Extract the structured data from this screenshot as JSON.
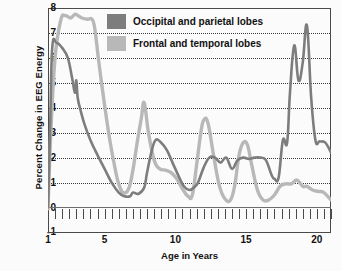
{
  "chart_data": {
    "type": "line",
    "title": "",
    "xlabel": "Age in Years",
    "ylabel": "Percent Change in EEG Energy",
    "xlim": [
      1,
      21
    ],
    "ylim": [
      -1,
      8
    ],
    "xticks": [
      1,
      5,
      10,
      15,
      20
    ],
    "yticks": [
      -1,
      0,
      1,
      2,
      3,
      4,
      5,
      6,
      7,
      8
    ],
    "minor_tick_step": 0.5,
    "grid": "horizontal-dotted",
    "legend_position": "inside-top-center",
    "series": [
      {
        "name": "Occipital and parietal lobes",
        "color": "#7d7d7d",
        "x": [
          1.0,
          1.15,
          1.3,
          1.6,
          2.0,
          2.4,
          2.7,
          2.9,
          3.0,
          3.1,
          3.3,
          3.6,
          4.0,
          4.5,
          5.0,
          5.5,
          6.0,
          6.4,
          6.8,
          7.0,
          7.4,
          7.8,
          8.0,
          8.3,
          8.6,
          9.0,
          9.4,
          9.8,
          10.2,
          10.6,
          11.0,
          11.3,
          11.6,
          12.0,
          12.4,
          12.8,
          13.2,
          13.6,
          14.0,
          14.4,
          14.8,
          15.2,
          15.6,
          16.0,
          16.4,
          16.8,
          17.0,
          17.3,
          17.6,
          17.9,
          18.1,
          18.4,
          18.7,
          19.0,
          19.3,
          19.6,
          19.9,
          20.2,
          20.6,
          21.0
        ],
        "y": [
          0.0,
          3.2,
          6.4,
          6.6,
          6.4,
          6.0,
          5.2,
          4.6,
          5.1,
          4.4,
          3.9,
          3.3,
          2.7,
          2.1,
          1.55,
          1.0,
          0.6,
          0.45,
          0.45,
          0.6,
          0.55,
          0.8,
          1.4,
          2.2,
          2.7,
          2.6,
          2.3,
          1.8,
          1.3,
          0.85,
          0.7,
          0.8,
          1.0,
          1.6,
          2.0,
          2.0,
          1.8,
          2.0,
          1.55,
          1.9,
          2.0,
          1.95,
          2.0,
          2.0,
          1.9,
          1.3,
          1.15,
          1.2,
          2.7,
          2.6,
          4.6,
          6.5,
          5.1,
          5.8,
          7.3,
          4.4,
          2.7,
          2.65,
          2.6,
          2.2
        ]
      },
      {
        "name": "Frontal and temporal lobes",
        "color": "#b8b8b8",
        "x": [
          1.0,
          1.2,
          1.5,
          1.9,
          2.2,
          2.6,
          2.9,
          3.1,
          3.4,
          3.8,
          4.1,
          4.3,
          4.6,
          5.0,
          5.4,
          5.8,
          6.0,
          6.3,
          6.7,
          7.0,
          7.3,
          7.6,
          7.8,
          8.1,
          8.5,
          8.9,
          9.3,
          9.7,
          10.1,
          10.5,
          10.9,
          11.2,
          11.5,
          11.8,
          12.0,
          12.3,
          12.7,
          13.1,
          13.5,
          13.9,
          14.2,
          14.5,
          14.8,
          15.1,
          15.4,
          15.8,
          16.2,
          16.6,
          17.0,
          17.4,
          17.8,
          18.2,
          18.6,
          19.0,
          19.3,
          19.7,
          20.1,
          20.5,
          21.0
        ],
        "y": [
          -0.05,
          3.0,
          6.0,
          7.5,
          7.7,
          7.6,
          7.75,
          7.7,
          7.6,
          7.55,
          7.55,
          7.2,
          5.8,
          4.1,
          2.6,
          1.4,
          0.95,
          0.6,
          0.75,
          1.5,
          2.6,
          3.6,
          4.2,
          3.0,
          1.9,
          1.55,
          1.5,
          1.4,
          1.15,
          0.75,
          0.45,
          0.5,
          1.7,
          3.0,
          3.5,
          3.4,
          2.1,
          0.9,
          0.35,
          0.3,
          0.9,
          2.1,
          2.6,
          2.5,
          1.7,
          0.7,
          0.3,
          0.3,
          0.5,
          0.85,
          0.95,
          0.95,
          1.1,
          0.85,
          0.85,
          0.7,
          0.65,
          0.6,
          0.3
        ]
      }
    ]
  },
  "legend": {
    "items": [
      {
        "label": "Occipital and parietal lobes",
        "color": "#7d7d7d"
      },
      {
        "label": "Frontal and temporal lobes",
        "color": "#b8b8b8"
      }
    ]
  },
  "axes": {
    "y_title": "Percent Change in EEG Energy",
    "x_title": "Age in Years",
    "y_tick_labels": [
      "8",
      "7",
      "6",
      "5",
      "4",
      "3",
      "2",
      "1",
      "0",
      "-1"
    ],
    "x_tick_labels": [
      "1",
      "5",
      "10",
      "15",
      "20"
    ]
  }
}
